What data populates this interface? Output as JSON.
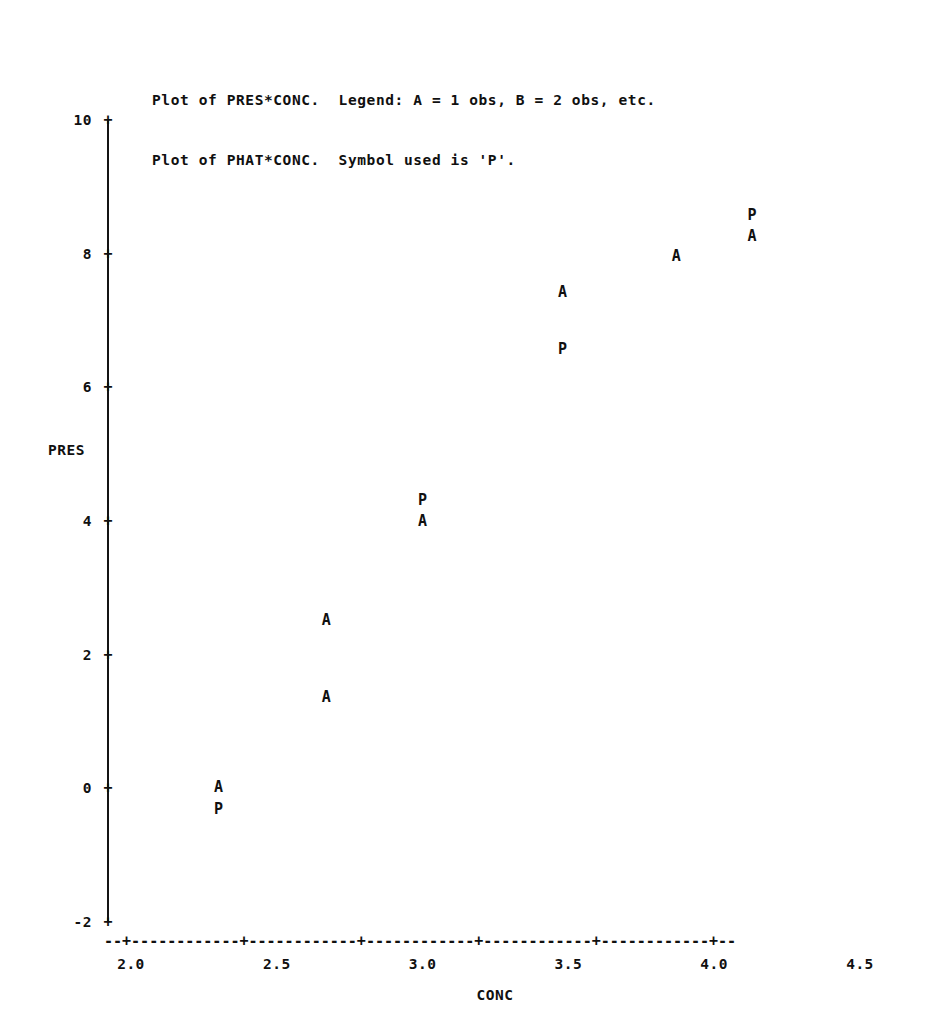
{
  "header": {
    "line1": "Plot of PRES*CONC.  Legend: A = 1 obs, B = 2 obs, etc.",
    "line2": "Plot of PHAT*CONC.  Symbol used is 'P'."
  },
  "axis_name_y": "PRES",
  "axis_name_x": "CONC",
  "tick_glyph": "+",
  "x_axis_rule": "--+------------+------------+------------+------------+------------+--",
  "chart_data": {
    "type": "scatter",
    "title": "Plot of PRES*CONC.  Legend: A = 1 obs, B = 2 obs, etc.",
    "subtitle": "Plot of PHAT*CONC.  Symbol used is 'P'.",
    "xlabel": "CONC",
    "ylabel": "PRES",
    "xlim": [
      1.93,
      4.62
    ],
    "ylim": [
      -2,
      10
    ],
    "xticks": [
      2.0,
      2.5,
      3.0,
      3.5,
      4.0,
      4.5
    ],
    "xtick_labels": [
      "2.0",
      "2.5",
      "3.0",
      "3.5",
      "4.0",
      "4.5"
    ],
    "yticks": [
      -2,
      0,
      2,
      4,
      6,
      8,
      10
    ],
    "ytick_labels": [
      "-2",
      "0",
      "2",
      "4",
      "6",
      "8",
      "10"
    ],
    "grid": false,
    "legend": "A = 1 obs, B = 2 obs, etc.; P = PHAT predicted value",
    "series": [
      {
        "name": "PRES (observed)",
        "symbol": "A",
        "points": [
          {
            "x": 2.3,
            "y": 0.02
          },
          {
            "x": 2.67,
            "y": 2.52
          },
          {
            "x": 2.67,
            "y": 1.37
          },
          {
            "x": 3.0,
            "y": 4.0
          },
          {
            "x": 3.48,
            "y": 7.43
          },
          {
            "x": 3.87,
            "y": 7.96
          },
          {
            "x": 4.13,
            "y": 8.27
          }
        ]
      },
      {
        "name": "PHAT (predicted)",
        "symbol": "P",
        "points": [
          {
            "x": 2.3,
            "y": -0.31
          },
          {
            "x": 3.0,
            "y": 4.31
          },
          {
            "x": 3.48,
            "y": 6.58
          },
          {
            "x": 4.13,
            "y": 8.58
          }
        ]
      }
    ]
  }
}
